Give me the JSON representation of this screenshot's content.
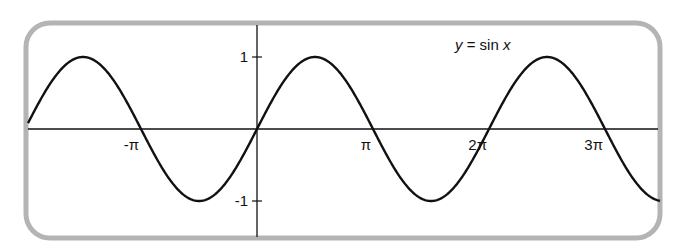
{
  "chart_data": {
    "type": "line",
    "title": "",
    "xlabel": "",
    "ylabel": "",
    "function": "y = sin x",
    "series": [
      {
        "name": "y = sin x",
        "label_parts": [
          "y",
          " = sin ",
          "x"
        ]
      }
    ],
    "xlim_pi_units": [
      -2.0,
      3.5
    ],
    "ylim": [
      -1.25,
      1.25
    ],
    "x_ticks": [
      {
        "value_pi": -1,
        "label": "-π"
      },
      {
        "value_pi": 1,
        "label": "π"
      },
      {
        "value_pi": 2,
        "label": "2π"
      },
      {
        "value_pi": 3,
        "label": "3π"
      }
    ],
    "y_ticks": [
      {
        "value": 1,
        "label": "1"
      },
      {
        "value": -1,
        "label": "-1"
      }
    ],
    "key_points": [
      {
        "x_pi": -1.5,
        "y": 1
      },
      {
        "x_pi": -1,
        "y": 0
      },
      {
        "x_pi": -0.5,
        "y": -1
      },
      {
        "x_pi": 0,
        "y": 0
      },
      {
        "x_pi": 0.5,
        "y": 1
      },
      {
        "x_pi": 1,
        "y": 0
      },
      {
        "x_pi": 1.5,
        "y": -1
      },
      {
        "x_pi": 2,
        "y": 0
      },
      {
        "x_pi": 2.5,
        "y": 1
      },
      {
        "x_pi": 3,
        "y": 0
      },
      {
        "x_pi": 3.5,
        "y": -1
      }
    ],
    "grid": false,
    "legend": "inline label near curve, upper right"
  },
  "layout": {
    "origin_px": [
      257,
      129
    ],
    "px_per_pi": 116,
    "px_per_unit_y": 72,
    "curve_x_start_px": 28,
    "curve_x_end_px": 660,
    "frame_color": "#b4b4b4",
    "curve_color": "#111111"
  }
}
